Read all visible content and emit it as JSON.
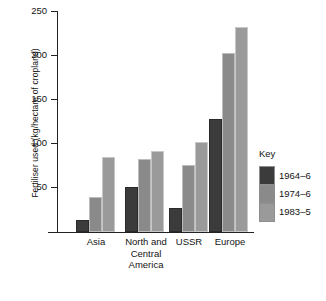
{
  "chart_data": {
    "type": "bar",
    "title": "",
    "xlabel": "",
    "ylabel": "Fertiliser used (kg/hectare of cropland)",
    "categories": [
      "Asia",
      "North and Central America",
      "USSR",
      "Europe"
    ],
    "series": [
      {
        "name": "1964–6",
        "color": "#3b3b3b",
        "values": [
          14,
          51,
          27,
          128
        ]
      },
      {
        "name": "1974–6",
        "color": "#8a8a8a",
        "values": [
          40,
          83,
          76,
          203
        ]
      },
      {
        "name": "1983–5",
        "color": "#9a9a9a",
        "values": [
          85,
          92,
          102,
          232
        ]
      }
    ],
    "ylim": [
      0,
      250
    ],
    "yticks": [
      0,
      50,
      100,
      150,
      200,
      250
    ],
    "ytick_labels": [
      "",
      "50",
      "100",
      "150",
      "200",
      "250"
    ],
    "grid": false,
    "legend_position": "right",
    "legend_title": "Key"
  },
  "axis": {
    "tick_250": "250",
    "tick_200": "200",
    "tick_150": "150",
    "tick_100": "100",
    "tick_50": "50"
  },
  "xlabels": {
    "asia": "Asia",
    "nca_line1": "North and",
    "nca_line2": "Central",
    "nca_line3": "America",
    "ussr": "USSR",
    "europe": "Europe"
  },
  "legend": {
    "title": "Key",
    "item1": "1964–6",
    "item2": "1974–6",
    "item3": "1983–5"
  }
}
